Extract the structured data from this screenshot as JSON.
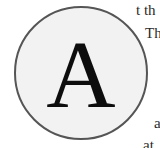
{
  "drop_cap": {
    "letter": "A",
    "circle_fill": "#f2f2f2",
    "circle_border": "#555555",
    "letter_color": "#0d0d0d"
  },
  "body_text": {
    "lines": [
      "t th",
      "Th",
      "a",
      "at"
    ]
  }
}
